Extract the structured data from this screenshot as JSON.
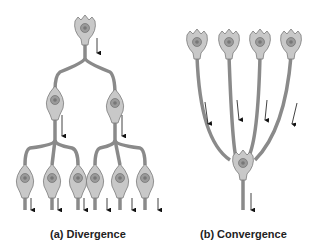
{
  "diagram": {
    "panels": [
      {
        "id": "a",
        "caption": "(a) Divergence",
        "neurons": 9,
        "description": "One presynaptic neuron branches to 2, each branching to 3 postsynaptic neurons"
      },
      {
        "id": "b",
        "caption": "(b) Convergence",
        "neurons": 5,
        "description": "Four presynaptic neurons converge onto one postsynaptic neuron"
      }
    ],
    "colors": {
      "neuron_fill": "#c8c8c8",
      "neuron_stroke": "#7a7a7a",
      "nucleus": "#9a9a9a",
      "arrow": "#111111"
    }
  }
}
